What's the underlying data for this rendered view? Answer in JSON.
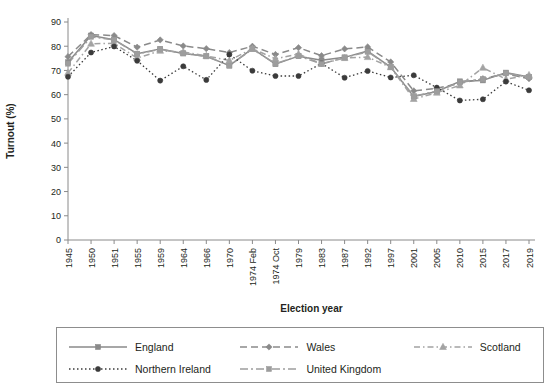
{
  "figure": {
    "background": "#ffffff",
    "axis_color": "#8a8a8a",
    "text_color": "#231f20"
  },
  "axes": {
    "x_title": "Election year",
    "y_title": "Turnout (%)",
    "y_ticks": [
      "0",
      "10",
      "20",
      "30",
      "40",
      "50",
      "60",
      "70",
      "80",
      "90"
    ],
    "x_ticks": [
      "1945",
      "1950",
      "1951",
      "1955",
      "1959",
      "1964",
      "1966",
      "1970",
      "1974 Feb",
      "1974 Oct",
      "1979",
      "1983",
      "1987",
      "1992",
      "1997",
      "2001",
      "2005",
      "2010",
      "2015",
      "2017",
      "2019"
    ]
  },
  "legend": {
    "rows": [
      [
        {
          "label": "England",
          "key": "england"
        },
        {
          "label": "Wales",
          "key": "wales"
        },
        {
          "label": "Scotland",
          "key": "scotland"
        }
      ],
      [
        {
          "label": "Northern Ireland",
          "key": "northern_ireland"
        },
        {
          "label": "United Kingdom",
          "key": "united_kingdom"
        },
        {
          "label": "",
          "key": ""
        }
      ]
    ]
  },
  "chart_data": {
    "type": "line",
    "title": "",
    "subtitle": "",
    "xlabel": "Election year",
    "ylabel": "Turnout (%)",
    "xlim": [
      0,
      20
    ],
    "ylim": [
      0,
      90
    ],
    "ytick_step": 10,
    "grid": false,
    "legend_position": "bottom",
    "categories": [
      "1945",
      "1950",
      "1951",
      "1955",
      "1959",
      "1964",
      "1966",
      "1970",
      "1974 Feb",
      "1974 Oct",
      "1979",
      "1983",
      "1987",
      "1992",
      "1997",
      "2001",
      "2005",
      "2010",
      "2015",
      "2017",
      "2019"
    ],
    "series": [
      {
        "name": "England",
        "key": "england",
        "color": "#8a8a8a",
        "marker": "square",
        "dash": "solid",
        "values": [
          73.4,
          84.4,
          82.7,
          76.9,
          78.9,
          77.0,
          75.9,
          72.0,
          79.0,
          72.6,
          75.9,
          74.2,
          75.4,
          78.0,
          71.4,
          59.2,
          61.3,
          65.5,
          65.9,
          69.1,
          67.3
        ]
      },
      {
        "name": "Wales",
        "key": "wales",
        "color": "#8a8a8a",
        "marker": "diamond",
        "dash": "dashed",
        "values": [
          75.7,
          84.8,
          84.4,
          79.6,
          82.6,
          80.1,
          79.0,
          77.4,
          80.0,
          76.6,
          79.4,
          76.1,
          78.9,
          79.7,
          73.5,
          61.6,
          62.6,
          64.7,
          66.6,
          68.6,
          66.6
        ]
      },
      {
        "name": "Scotland",
        "key": "scotland",
        "color": "#a3a3a3",
        "marker": "triangle",
        "dash": "dashdot-long",
        "values": [
          69.0,
          81.0,
          81.2,
          75.1,
          78.1,
          77.6,
          76.0,
          74.1,
          79.0,
          74.8,
          76.8,
          72.7,
          75.1,
          75.5,
          71.3,
          58.2,
          60.8,
          63.8,
          71.1,
          66.4,
          68.1
        ]
      },
      {
        "name": "Northern Ireland",
        "key": "northern_ireland",
        "color": "#3b3b3b",
        "marker": "circle",
        "dash": "dotted",
        "values": [
          67.4,
          77.4,
          79.9,
          74.0,
          65.8,
          71.7,
          66.1,
          76.6,
          69.9,
          67.7,
          67.7,
          72.9,
          67.0,
          69.8,
          67.1,
          68.0,
          62.9,
          57.6,
          58.1,
          65.4,
          61.8
        ]
      },
      {
        "name": "United Kingdom",
        "key": "united_kingdom",
        "color": "#9d9d9d",
        "marker": "square",
        "dash": "dashdot",
        "values": [
          72.8,
          83.9,
          82.6,
          76.8,
          78.7,
          77.1,
          75.8,
          72.0,
          78.8,
          72.8,
          76.0,
          72.7,
          75.3,
          77.7,
          71.4,
          59.4,
          61.4,
          65.1,
          66.4,
          68.8,
          67.3
        ]
      }
    ]
  }
}
